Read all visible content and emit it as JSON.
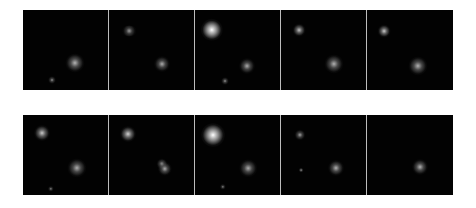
{
  "figure": {
    "background": "#020202",
    "divider_color": "#bdbdbd",
    "rows": [
      {
        "top": 10,
        "panels": [
          {
            "blobs": [
              {
                "x": 52,
                "y": 53,
                "r": 6,
                "i": 0.45
              },
              {
                "x": 29,
                "y": 70,
                "r": 2.5,
                "i": 0.2
              }
            ]
          },
          {
            "blobs": [
              {
                "x": 20,
                "y": 21,
                "r": 3.5,
                "i": 0.25,
                "sx": 1.4
              },
              {
                "x": 53,
                "y": 54,
                "r": 5,
                "i": 0.38
              }
            ]
          },
          {
            "blobs": [
              {
                "x": 17,
                "y": 20,
                "r": 7,
                "i": 1.0
              },
              {
                "x": 52,
                "y": 56,
                "r": 5,
                "i": 0.38
              },
              {
                "x": 30,
                "y": 71,
                "r": 2.5,
                "i": 0.2
              }
            ]
          },
          {
            "blobs": [
              {
                "x": 18,
                "y": 20,
                "r": 4,
                "i": 0.55
              },
              {
                "x": 53,
                "y": 54,
                "r": 6,
                "i": 0.42
              }
            ]
          },
          {
            "blobs": [
              {
                "x": 17,
                "y": 21,
                "r": 4,
                "i": 0.6
              },
              {
                "x": 51,
                "y": 56,
                "r": 6,
                "i": 0.42
              }
            ]
          }
        ]
      },
      {
        "top": 115,
        "panels": [
          {
            "blobs": [
              {
                "x": 19,
                "y": 18,
                "r": 5,
                "i": 0.6
              },
              {
                "x": 54,
                "y": 53,
                "r": 6,
                "i": 0.4
              },
              {
                "x": 28,
                "y": 74,
                "r": 2,
                "i": 0.12
              }
            ]
          },
          {
            "blobs": [
              {
                "x": 19,
                "y": 19,
                "r": 5,
                "i": 0.65
              },
              {
                "x": 53,
                "y": 49,
                "r": 3.5,
                "i": 0.3
              },
              {
                "x": 56,
                "y": 54,
                "r": 4.5,
                "i": 0.38
              }
            ]
          },
          {
            "blobs": [
              {
                "x": 18,
                "y": 20,
                "r": 7.5,
                "i": 1.0
              },
              {
                "x": 53,
                "y": 53,
                "r": 5.5,
                "i": 0.38
              },
              {
                "x": 28,
                "y": 72,
                "r": 2,
                "i": 0.12
              }
            ]
          },
          {
            "blobs": [
              {
                "x": 19,
                "y": 20,
                "r": 3.5,
                "i": 0.3
              },
              {
                "x": 55,
                "y": 53,
                "r": 5,
                "i": 0.42
              },
              {
                "x": 20,
                "y": 55,
                "r": 1.5,
                "i": 0.25
              }
            ]
          },
          {
            "blobs": [
              {
                "x": 53,
                "y": 52,
                "r": 5,
                "i": 0.42
              }
            ]
          }
        ]
      }
    ]
  }
}
